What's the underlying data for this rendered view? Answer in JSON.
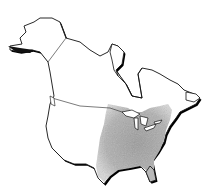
{
  "map": {
    "region": "North America",
    "description": "Outline map of North America (Alaska, Canada, contiguous United States) with a shaded range covering the eastern United States",
    "colors": {
      "background": "#ffffff",
      "outline": "#111111",
      "shadow": "#000000",
      "range_fill": "#a8a8a8"
    },
    "shaded_range": "Eastern United States, from the Great Plains to the Atlantic coast and Gulf coast, north to the Great Lakes and southern Quebec/Maine"
  }
}
